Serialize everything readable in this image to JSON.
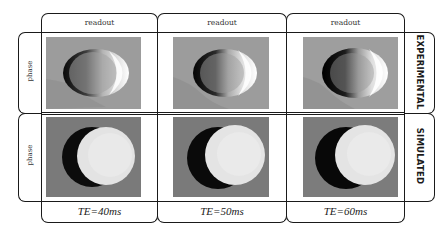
{
  "figure": {
    "column_header_label": "readout",
    "columns": [
      {
        "header": "readout",
        "footer": "TE=40ms"
      },
      {
        "header": "readout",
        "footer": "TE=50ms"
      },
      {
        "header": "readout",
        "footer": "TE=60ms"
      }
    ],
    "rows": [
      {
        "axis_label": "phase",
        "row_label": "EXPERIMENTAL"
      },
      {
        "axis_label": "phase",
        "row_label": "SIMULATED"
      }
    ],
    "colors": {
      "frame": "#1a1a1a",
      "experimental_background": "#9a9a9a",
      "simulated_background": "#7c7c7c",
      "dark_lobe": "#0e0e0e",
      "bright_lobe": "#e6e6e6"
    },
    "tiles": [
      {
        "row": "EXPERIMENTAL",
        "te": "TE=40ms"
      },
      {
        "row": "EXPERIMENTAL",
        "te": "TE=50ms"
      },
      {
        "row": "EXPERIMENTAL",
        "te": "TE=60ms"
      },
      {
        "row": "SIMULATED",
        "te": "TE=40ms"
      },
      {
        "row": "SIMULATED",
        "te": "TE=50ms"
      },
      {
        "row": "SIMULATED",
        "te": "TE=60ms"
      }
    ]
  }
}
